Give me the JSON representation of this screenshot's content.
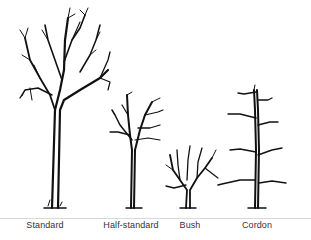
{
  "diagram": {
    "trees": [
      {
        "label": "Standard",
        "center_x": 45
      },
      {
        "label": "Half-standard",
        "center_x": 131
      },
      {
        "label": "Bush",
        "center_x": 190
      },
      {
        "label": "Cordon",
        "center_x": 257
      }
    ],
    "colors": {
      "ink": "#111111",
      "background": "#ffffff",
      "baseline": "#d8d8d8",
      "label": "#333333"
    }
  }
}
